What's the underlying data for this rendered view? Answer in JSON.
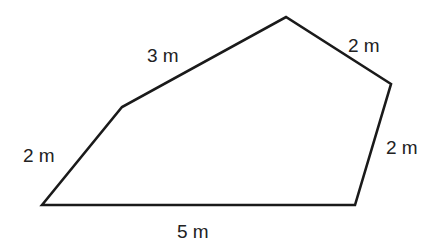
{
  "diagram": {
    "type": "pentagon",
    "stroke_color": "#1a1a1a",
    "label_color": "#222222",
    "vertices": [
      {
        "name": "bottom-left",
        "x": 42,
        "y": 205
      },
      {
        "name": "upper-left",
        "x": 122,
        "y": 107
      },
      {
        "name": "top",
        "x": 286,
        "y": 17
      },
      {
        "name": "right",
        "x": 391,
        "y": 84
      },
      {
        "name": "bottom-right",
        "x": 355,
        "y": 205
      }
    ],
    "sides": [
      {
        "id": "left",
        "label": "2 m"
      },
      {
        "id": "top-left",
        "label": "3 m"
      },
      {
        "id": "top-right",
        "label": "2 m"
      },
      {
        "id": "right",
        "label": "2 m"
      },
      {
        "id": "bottom",
        "label": "5 m"
      }
    ]
  }
}
